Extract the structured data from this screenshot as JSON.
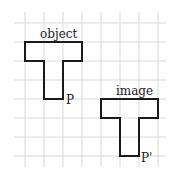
{
  "diagram": {
    "type": "translation-grid",
    "grid": {
      "cell_px": 19,
      "line_color": "#d9d9d9",
      "x_lines": [
        25,
        44,
        63,
        82,
        101,
        120,
        139,
        158
      ],
      "y_lines": [
        23,
        42,
        61,
        80,
        99,
        118,
        137,
        156
      ]
    },
    "object": {
      "label": "object",
      "point_label": "P"
    },
    "image": {
      "label": "image",
      "point_label": "P'"
    },
    "stroke_color": "#1a1a1a"
  }
}
